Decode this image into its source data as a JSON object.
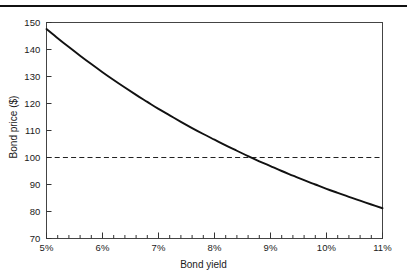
{
  "figure": {
    "has_top_rule": true,
    "background": "#ffffff",
    "ink_color": "#111111"
  },
  "chart_data": {
    "type": "line",
    "title": "",
    "subtitle": "",
    "xlabel": "Bond yield",
    "ylabel": "Bond price ($)",
    "xlim": [
      5,
      11
    ],
    "ylim": [
      70,
      150
    ],
    "grid": false,
    "legend": null,
    "x_tick_labels": [
      "5%",
      "6%",
      "7%",
      "8%",
      "9%",
      "10%",
      "11%"
    ],
    "x_tick_values": [
      5,
      6,
      7,
      8,
      9,
      10,
      11
    ],
    "x_minor_ticks_per_interval": 4,
    "y_tick_labels": [
      "70",
      "80",
      "90",
      "100",
      "110",
      "120",
      "130",
      "140",
      "150"
    ],
    "y_tick_values": [
      70,
      80,
      90,
      100,
      110,
      120,
      130,
      140,
      150
    ],
    "series": [
      {
        "name": "Bond price",
        "style": "solid",
        "color": "#111111",
        "x": [
          5.0,
          5.2,
          5.4,
          5.6,
          5.8,
          6.0,
          6.2,
          6.4,
          6.6,
          6.8,
          7.0,
          7.2,
          7.4,
          7.6,
          7.8,
          8.0,
          8.2,
          8.4,
          8.6,
          8.8,
          9.0,
          9.2,
          9.4,
          9.6,
          9.8,
          10.0,
          10.2,
          10.4,
          10.6,
          10.8,
          11.0
        ],
        "y": [
          147.6,
          144.2,
          140.9,
          137.7,
          134.6,
          131.6,
          128.7,
          125.9,
          123.2,
          120.6,
          118.0,
          115.6,
          113.2,
          110.9,
          108.7,
          106.6,
          104.5,
          102.5,
          100.5,
          98.6,
          96.8,
          95.0,
          93.3,
          91.6,
          90.0,
          88.4,
          86.9,
          85.4,
          84.0,
          82.6,
          81.2
        ]
      }
    ],
    "reference_lines": [
      {
        "name": "par-value-line",
        "orientation": "horizontal",
        "value": 100,
        "style": "dashed",
        "color": "#222222"
      }
    ],
    "annotations": []
  }
}
